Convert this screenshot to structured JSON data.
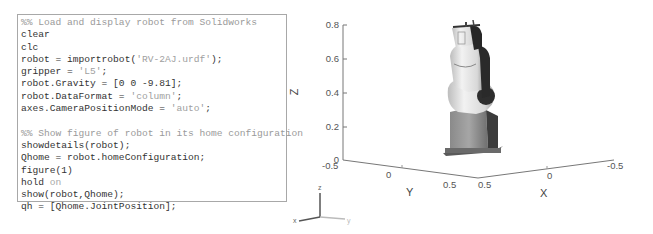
{
  "code_editor": {
    "lines": [
      [
        {
          "t": "%% Load and display robot from Solidworks",
          "k": "comment"
        }
      ],
      [
        {
          "t": "clear",
          "k": "code"
        }
      ],
      [
        {
          "t": "clc",
          "k": "code"
        }
      ],
      [
        {
          "t": "robot = importrobot(",
          "k": "code"
        },
        {
          "t": "'RV-2AJ.urdf'",
          "k": "string"
        },
        {
          "t": ");",
          "k": "code"
        }
      ],
      [
        {
          "t": "gripper = ",
          "k": "code"
        },
        {
          "t": "'L5'",
          "k": "string"
        },
        {
          "t": ";",
          "k": "code"
        }
      ],
      [
        {
          "t": "robot.Gravity = [0 0 -9.81];",
          "k": "code"
        }
      ],
      [
        {
          "t": "robot.DataFormat = ",
          "k": "code"
        },
        {
          "t": "'column'",
          "k": "string"
        },
        {
          "t": ";",
          "k": "code"
        }
      ],
      [
        {
          "t": "axes.CameraPositionMode = ",
          "k": "code"
        },
        {
          "t": "'auto'",
          "k": "string"
        },
        {
          "t": ";",
          "k": "code"
        }
      ],
      [
        {
          "t": "",
          "k": "code"
        }
      ],
      [
        {
          "t": "%% Show figure of robot in its home configuration",
          "k": "comment"
        }
      ],
      [
        {
          "t": "showdetails(robot);",
          "k": "code"
        }
      ],
      [
        {
          "t": "Qhome = robot.homeConfiguration;",
          "k": "code"
        }
      ],
      [
        {
          "t": "figure(1)",
          "k": "code"
        }
      ],
      [
        {
          "t": "hold ",
          "k": "code"
        },
        {
          "t": "on",
          "k": "keyword"
        }
      ],
      [
        {
          "t": "show(robot,Qhome);",
          "k": "code"
        }
      ],
      [
        {
          "t": "qh = [Qhome.JointPosition];",
          "k": "code"
        }
      ]
    ]
  },
  "figure": {
    "z_axis": {
      "label": "Z",
      "ticks": [
        {
          "label": "0.8",
          "y": 25
        },
        {
          "label": "0.6",
          "y": 59
        },
        {
          "label": "0.4",
          "y": 93
        },
        {
          "label": "0.2",
          "y": 127
        },
        {
          "label": "0",
          "y": 160
        }
      ]
    },
    "y_axis": {
      "label": "Y",
      "ticks": [
        {
          "label": "-0.5",
          "x": 42,
          "y": 162
        },
        {
          "label": "0",
          "x": 106,
          "y": 171
        },
        {
          "label": "0.5",
          "x": 163,
          "y": 181
        }
      ]
    },
    "x_axis": {
      "label": "X",
      "ticks": [
        {
          "label": "0.5",
          "x": 194,
          "y": 181
        },
        {
          "label": "0",
          "x": 263,
          "y": 172
        },
        {
          "label": "-0.5",
          "x": 323,
          "y": 162
        }
      ]
    },
    "triad": {
      "x": "x",
      "y": "y",
      "z": "z"
    }
  }
}
